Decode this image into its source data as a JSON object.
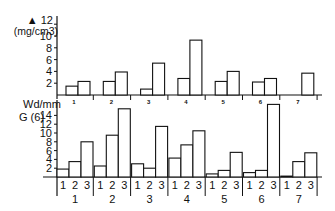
{
  "chart_data": [
    {
      "type": "bar",
      "title": "",
      "ylabel_line1": "▲ 12",
      "ylabel_unit": "(mg/cm3)",
      "yticks": [
        2,
        4,
        6,
        8,
        10,
        12
      ],
      "ylim": [
        0,
        12
      ],
      "xlabel": "",
      "categories": [
        "1",
        "2",
        "3",
        "4",
        "5",
        "6",
        "7"
      ],
      "bars_per_group": 2,
      "values": [
        [
          1.5,
          2.3
        ],
        [
          2.3,
          3.9
        ],
        [
          1.0,
          5.4
        ],
        [
          2.8,
          9.3
        ],
        [
          2.3,
          4.0
        ],
        [
          2.2,
          2.8
        ],
        [
          null,
          3.7
        ]
      ],
      "grid": false,
      "legend": null
    },
    {
      "type": "bar",
      "title": "",
      "ylabel_line1": "Wd/mm",
      "ylabel_line2": "G (6)",
      "yticks": [
        2,
        4,
        6,
        8,
        10,
        12,
        14
      ],
      "ylim": [
        0,
        14
      ],
      "xlabel": "",
      "categories": [
        "1",
        "2",
        "3",
        "4",
        "5",
        "6",
        "7"
      ],
      "subcategories": [
        "1",
        "2",
        "3"
      ],
      "values": [
        [
          1.8,
          3.5,
          8.0
        ],
        [
          2.5,
          9.5,
          15.5
        ],
        [
          3.0,
          2.0,
          11.5
        ],
        [
          4.3,
          7.3,
          10.5
        ],
        [
          0.7,
          1.5,
          5.6
        ],
        [
          1.0,
          1.5,
          16.5
        ],
        [
          0.2,
          3.5,
          5.5
        ]
      ],
      "grid": false,
      "legend": null
    }
  ]
}
